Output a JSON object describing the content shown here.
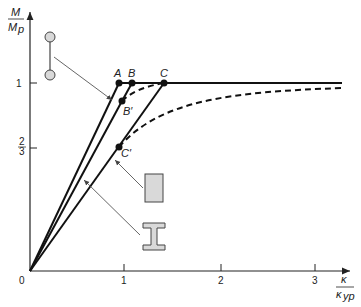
{
  "diagram": {
    "type": "moment-curvature",
    "y_axis": {
      "label_num": "M",
      "label_den": "M",
      "label_den_sub": "p",
      "ticks": [
        {
          "label": "1",
          "value": 1
        },
        {
          "label_num": "2",
          "label_den": "3",
          "value": 0.6667
        }
      ]
    },
    "x_axis": {
      "label_num": "κ",
      "label_den": "κ",
      "label_den_sub": "yp",
      "ticks": [
        "0",
        "1",
        "2",
        "3"
      ]
    },
    "points": [
      {
        "name": "A",
        "label": "A"
      },
      {
        "name": "B",
        "label": "B"
      },
      {
        "name": "C",
        "label": "C"
      },
      {
        "name": "B-prime",
        "label": "B′"
      },
      {
        "name": "C-prime",
        "label": "C′"
      }
    ],
    "sections": [
      "ideal-sandwich",
      "rectangular",
      "I-beam"
    ],
    "colors": {
      "line": "#111111",
      "section_fill": "#d9d9d9",
      "arrow": "#555555"
    }
  }
}
